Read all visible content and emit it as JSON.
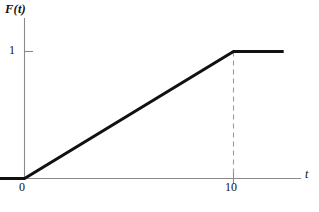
{
  "figure": {
    "caption": "",
    "background_color": "#ffffff",
    "width": 319,
    "height": 212
  },
  "axes": {
    "y_label": "F(t)",
    "x_label": "t",
    "y_ticks": [
      {
        "label": "1",
        "value": 1
      }
    ],
    "x_ticks": [
      {
        "label": "0",
        "value": 0
      },
      {
        "label": "10",
        "value": 10
      }
    ],
    "axis_color": "#8a8a8a",
    "curve_color": "#111111",
    "guide_color": "#9b9b9b"
  },
  "chart_data": {
    "type": "line",
    "title": "",
    "xlabel": "t",
    "ylabel": "F(t)",
    "xlim": [
      -2.2,
      12.4
    ],
    "ylim": [
      0,
      1.32
    ],
    "grid": false,
    "legend": false,
    "annotations": [
      {
        "kind": "dashed-vertical-guide",
        "x": 10,
        "y_from": 0,
        "y_to": 1,
        "style": "dashed"
      }
    ],
    "series": [
      {
        "name": "F(t)",
        "style": "solid",
        "linewidth": 3,
        "color": "#111111",
        "x": [
          -2.2,
          0,
          10,
          12.4
        ],
        "y": [
          0,
          0,
          1,
          1
        ]
      }
    ]
  }
}
